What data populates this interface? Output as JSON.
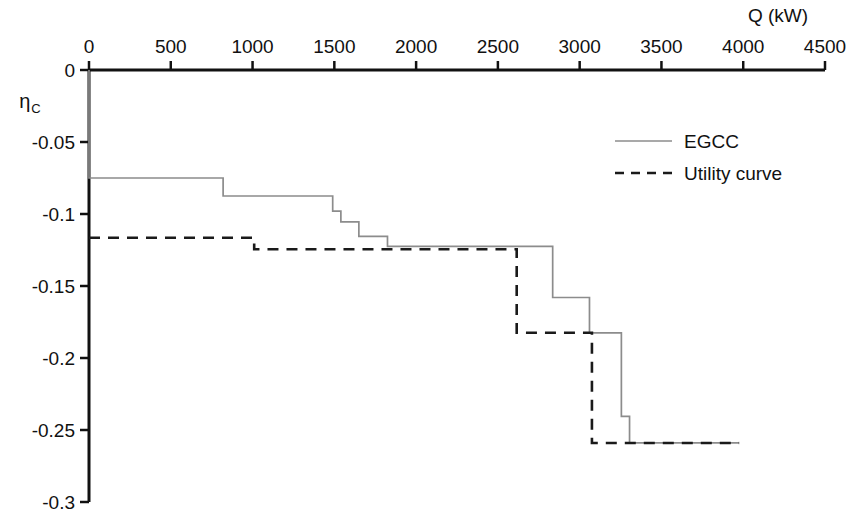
{
  "chart_data": {
    "type": "line",
    "title": "",
    "xlabel": "Q (kW)",
    "ylabel": "ηC",
    "ylabel_main": "η",
    "ylabel_sub": "C",
    "xlim": [
      0,
      4500
    ],
    "ylim": [
      -0.3,
      0
    ],
    "xticks": [
      0,
      500,
      1000,
      1500,
      2000,
      2500,
      3000,
      3500,
      4000,
      4500
    ],
    "xtick_labels": [
      "0",
      "500",
      "1000",
      "1500",
      "2000",
      "2500",
      "3000",
      "3500",
      "4000",
      "4500"
    ],
    "yticks": [
      0,
      -0.05,
      -0.1,
      -0.15,
      -0.2,
      -0.25,
      -0.3
    ],
    "ytick_labels": [
      "0",
      "-0.05",
      "-0.1",
      "-0.15",
      "-0.2",
      "-0.25",
      "-0.3"
    ],
    "grid": false,
    "x_axis_position": "top",
    "legend_position": "upper-center-right",
    "series": [
      {
        "name": "EGCC",
        "style": "solid",
        "color": "#8c8c8c",
        "step": "post",
        "points": [
          [
            0,
            0
          ],
          [
            0,
            -0.075
          ],
          [
            820,
            -0.075
          ],
          [
            820,
            -0.0875
          ],
          [
            1490,
            -0.0875
          ],
          [
            1490,
            -0.098
          ],
          [
            1540,
            -0.098
          ],
          [
            1540,
            -0.1055
          ],
          [
            1650,
            -0.1055
          ],
          [
            1650,
            -0.1155
          ],
          [
            1825,
            -0.1155
          ],
          [
            1825,
            -0.1225
          ],
          [
            2835,
            -0.1225
          ],
          [
            2835,
            -0.158
          ],
          [
            3060,
            -0.158
          ],
          [
            3060,
            -0.1825
          ],
          [
            3255,
            -0.1825
          ],
          [
            3255,
            -0.2405
          ],
          [
            3305,
            -0.2405
          ],
          [
            3305,
            -0.259
          ],
          [
            3975,
            -0.259
          ]
        ]
      },
      {
        "name": "Utility curve",
        "style": "dashed",
        "color": "#1a1a1a",
        "step": "post",
        "points": [
          [
            0,
            -0.1165
          ],
          [
            1010,
            -0.1165
          ],
          [
            1010,
            -0.1245
          ],
          [
            2615,
            -0.1245
          ],
          [
            2615,
            -0.1825
          ],
          [
            3075,
            -0.1825
          ],
          [
            3075,
            -0.259
          ],
          [
            3975,
            -0.259
          ]
        ]
      }
    ],
    "legend": [
      {
        "label": "EGCC",
        "style": "solid",
        "color": "#8c8c8c"
      },
      {
        "label": "Utility curve",
        "style": "dashed",
        "color": "#1a1a1a"
      }
    ]
  }
}
